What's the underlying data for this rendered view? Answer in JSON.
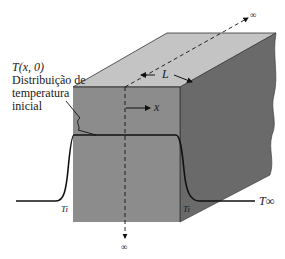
{
  "diagram": {
    "type": "semi-infinite solid slab with initial temperature distribution",
    "labels": {
      "initial_dist_line1": "T(x, 0)",
      "initial_dist_line2": "Distribuição de",
      "initial_dist_line3": "temperatura",
      "initial_dist_line4": "inicial",
      "thickness": "L",
      "x_axis": "x",
      "infinity_top": "∞",
      "infinity_bottom": "∞",
      "t_left": "Ti",
      "t_right": "Ti",
      "t_ambient": "T∞"
    },
    "colors": {
      "front_face": "#8c8c8c",
      "top_face": "#c4c4c4",
      "side_face": "#6a6a6a",
      "line": "#111111",
      "background": "#ffffff"
    }
  }
}
